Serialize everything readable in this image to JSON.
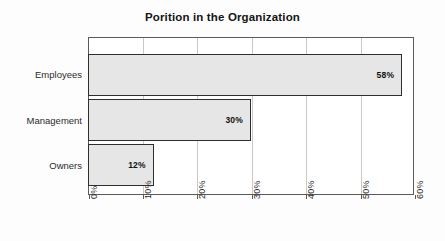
{
  "chart_data": {
    "type": "bar",
    "orientation": "horizontal",
    "title": "Porition in the Organization",
    "xlabel": "",
    "ylabel": "",
    "categories": [
      "Employees",
      "Management",
      "Owners"
    ],
    "values": [
      58,
      30,
      12
    ],
    "data_labels": [
      "58%",
      "30%",
      "12%"
    ],
    "xlim": [
      0,
      60
    ],
    "xticks": [
      0,
      10,
      20,
      30,
      40,
      50,
      60
    ],
    "xtick_labels": [
      "0%",
      "10%",
      "20%",
      "30%",
      "40%",
      "50%",
      "60%"
    ],
    "grid": true,
    "grid_axis": "x",
    "legend": false,
    "bar_fill_color": "#e6e6e6",
    "bar_border_color": "#2e2e2e",
    "grid_color": "#c9c9c9",
    "axis_color": "#5a5a5a",
    "background_color": "#ffffff",
    "title_color": "#141414"
  },
  "chart": {
    "title": "Porition in the Organization",
    "bars": [
      {
        "label": "Employees",
        "value_text": "58%"
      },
      {
        "label": "Management",
        "value_text": "30%"
      },
      {
        "label": "Owners",
        "value_text": "12%"
      }
    ],
    "xticks": [
      {
        "label": "0%"
      },
      {
        "label": "10%"
      },
      {
        "label": "20%"
      },
      {
        "label": "30%"
      },
      {
        "label": "40%"
      },
      {
        "label": "50%"
      },
      {
        "label": "60%"
      }
    ]
  }
}
